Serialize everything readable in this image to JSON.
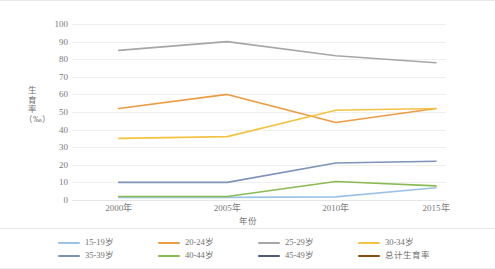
{
  "chart_data": {
    "type": "line",
    "title": "",
    "xlabel": "年份",
    "ylabel": "生育率（‰）",
    "categories": [
      "2000年",
      "2005年",
      "2010年",
      "2015年"
    ],
    "ylim": [
      0,
      100
    ],
    "ytick_labels": [
      "0",
      "10",
      "20",
      "30",
      "40",
      "50",
      "60",
      "70",
      "80",
      "90",
      "100"
    ],
    "yticks": [
      0,
      10,
      20,
      30,
      40,
      50,
      60,
      70,
      80,
      90,
      100
    ],
    "grid": true,
    "legend_position": "bottom",
    "series": [
      {
        "name": "15-19岁",
        "color": "#9cc3e5",
        "values": [
          1.5,
          1.5,
          1.8,
          7.0
        ]
      },
      {
        "name": "20-24岁",
        "color": "#ed9b42",
        "values": [
          52.0,
          60.0,
          44.0,
          52.0
        ]
      },
      {
        "name": "25-29岁",
        "color": "#a6a6a6",
        "values": [
          85.0,
          90.0,
          82.0,
          78.0
        ]
      },
      {
        "name": "30-34岁",
        "color": "#f5c342",
        "values": [
          35.0,
          36.0,
          51.0,
          52.0
        ]
      },
      {
        "name": "35-39岁",
        "color": "#7d93b8",
        "values": [
          10.0,
          10.0,
          21.0,
          22.0
        ]
      },
      {
        "name": "40-44岁",
        "color": "#8cba53",
        "values": [
          2.0,
          2.0,
          10.5,
          8.0
        ]
      },
      {
        "name": "45-49岁",
        "color": "#4a5a78",
        "values": [
          0,
          0,
          0,
          0
        ]
      },
      {
        "name": "总计生育率",
        "color": "#8c4b10",
        "values": [
          0,
          0,
          0,
          0
        ]
      }
    ]
  },
  "axes": {
    "y_title": "生育率（‰）",
    "x_title": "年份"
  },
  "legend": {
    "items": [
      {
        "label": "15-19岁",
        "color": "#9cc3e5"
      },
      {
        "label": "20-24岁",
        "color": "#ed9b42"
      },
      {
        "label": "25-29岁",
        "color": "#a6a6a6"
      },
      {
        "label": "30-34岁",
        "color": "#f5c342"
      },
      {
        "label": "35-39岁",
        "color": "#7d93b8"
      },
      {
        "label": "40-44岁",
        "color": "#8cba53"
      },
      {
        "label": "45-49岁",
        "color": "#4a5a78"
      },
      {
        "label": "总计生育率",
        "color": "#8c4b10"
      }
    ]
  },
  "colors": {
    "gridline": "#efefef",
    "text": "#7a7a7a",
    "background": "#ffffff"
  }
}
